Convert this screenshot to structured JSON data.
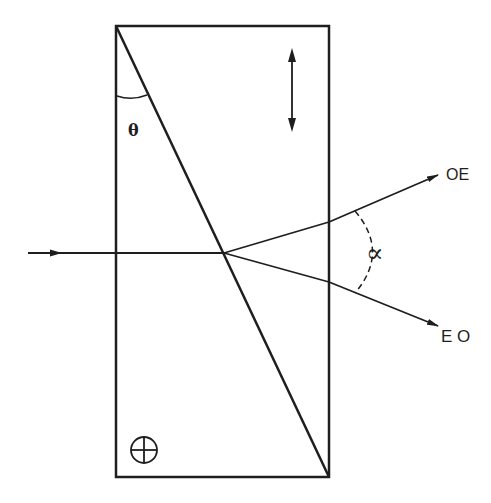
{
  "diagram": {
    "type": "optics-prism",
    "labels": {
      "theta": "θ",
      "alpha": "∝",
      "upper_ray": "OE",
      "lower_ray": "E O"
    },
    "colors": {
      "ink": "#1e1e1e",
      "background": "#ffffff"
    },
    "symbols": {
      "upper_wedge_axis": "double-arrow-vertical",
      "lower_wedge_axis": "circle-with-cross"
    }
  }
}
